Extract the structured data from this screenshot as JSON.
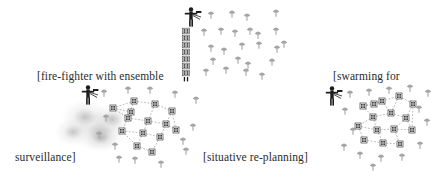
{
  "figure": {
    "kind": "scenario-diagram",
    "background_color": "#ffffff",
    "ink_color": "#2b2b2b",
    "agent_color": "#9a9a9a",
    "node_color": "#4a4a4a",
    "link_color": "#8d8d8d",
    "smoke_color": "#9a9a9a"
  },
  "labels": [
    {
      "id": "label-fire-fighter",
      "text": "[fire-fighter with ensemble",
      "x": 37,
      "y": 71
    },
    {
      "id": "label-surveillance",
      "text": "surveillance]",
      "x": 15,
      "y": 152
    },
    {
      "id": "label-situative-replanning",
      "text": "[situative re-planning]",
      "x": 203,
      "y": 152
    },
    {
      "id": "label-swarming-for",
      "text": "[swarming for",
      "x": 333,
      "y": 71
    }
  ],
  "scenes": [
    {
      "id": "scene-fire-fighter",
      "name": "fire-fighter with ensemble surveillance",
      "human": {
        "x": 88,
        "y": 96
      },
      "smoke_blobs": [
        {
          "x": 62,
          "y": 100,
          "w": 46,
          "h": 34
        },
        {
          "x": 74,
          "y": 112,
          "w": 52,
          "h": 40
        },
        {
          "x": 55,
          "y": 118,
          "w": 36,
          "h": 28
        },
        {
          "x": 92,
          "y": 104,
          "w": 40,
          "h": 30
        },
        {
          "x": 84,
          "y": 126,
          "w": 34,
          "h": 24
        }
      ],
      "nodes": [
        {
          "x": 113,
          "y": 108
        },
        {
          "x": 134,
          "y": 101
        },
        {
          "x": 155,
          "y": 104
        },
        {
          "x": 172,
          "y": 111
        },
        {
          "x": 128,
          "y": 118
        },
        {
          "x": 148,
          "y": 121
        },
        {
          "x": 166,
          "y": 124
        },
        {
          "x": 122,
          "y": 131
        },
        {
          "x": 143,
          "y": 133
        },
        {
          "x": 160,
          "y": 137
        },
        {
          "x": 176,
          "y": 130
        },
        {
          "x": 137,
          "y": 146
        },
        {
          "x": 152,
          "y": 152
        },
        {
          "x": 131,
          "y": 112
        }
      ],
      "links": [
        [
          0,
          1
        ],
        [
          1,
          2
        ],
        [
          2,
          3
        ],
        [
          0,
          4
        ],
        [
          4,
          5
        ],
        [
          5,
          6
        ],
        [
          3,
          6
        ],
        [
          1,
          4
        ],
        [
          2,
          5
        ],
        [
          4,
          7
        ],
        [
          7,
          8
        ],
        [
          8,
          9
        ],
        [
          9,
          6
        ],
        [
          6,
          10
        ],
        [
          3,
          10
        ],
        [
          5,
          8
        ],
        [
          8,
          11
        ],
        [
          11,
          12
        ],
        [
          9,
          12
        ],
        [
          7,
          11
        ],
        [
          0,
          13
        ],
        [
          13,
          4
        ]
      ],
      "agents": [
        {
          "x": 104,
          "y": 93
        },
        {
          "x": 128,
          "y": 90
        },
        {
          "x": 150,
          "y": 90
        },
        {
          "x": 175,
          "y": 94
        },
        {
          "x": 196,
          "y": 100
        },
        {
          "x": 106,
          "y": 118
        },
        {
          "x": 99,
          "y": 135
        },
        {
          "x": 115,
          "y": 146
        },
        {
          "x": 135,
          "y": 160
        },
        {
          "x": 161,
          "y": 164
        },
        {
          "x": 186,
          "y": 151
        },
        {
          "x": 193,
          "y": 127
        },
        {
          "x": 183,
          "y": 141
        },
        {
          "x": 119,
          "y": 159
        }
      ]
    },
    {
      "id": "scene-situative-replanning",
      "name": "situative re-planning",
      "human": {
        "x": 191,
        "y": 18
      },
      "stack": {
        "x": 186,
        "y": 31,
        "count": 7,
        "spacing": 7
      },
      "agents": [
        {
          "x": 211,
          "y": 15
        },
        {
          "x": 232,
          "y": 14
        },
        {
          "x": 247,
          "y": 17
        },
        {
          "x": 276,
          "y": 13
        },
        {
          "x": 204,
          "y": 32
        },
        {
          "x": 221,
          "y": 31
        },
        {
          "x": 235,
          "y": 33
        },
        {
          "x": 250,
          "y": 31
        },
        {
          "x": 258,
          "y": 35
        },
        {
          "x": 276,
          "y": 31
        },
        {
          "x": 211,
          "y": 48
        },
        {
          "x": 224,
          "y": 51
        },
        {
          "x": 242,
          "y": 46
        },
        {
          "x": 259,
          "y": 45
        },
        {
          "x": 277,
          "y": 49
        },
        {
          "x": 213,
          "y": 61
        },
        {
          "x": 238,
          "y": 60
        },
        {
          "x": 248,
          "y": 65
        },
        {
          "x": 272,
          "y": 62
        },
        {
          "x": 226,
          "y": 70
        },
        {
          "x": 246,
          "y": 72
        },
        {
          "x": 262,
          "y": 76
        },
        {
          "x": 206,
          "y": 72
        },
        {
          "x": 284,
          "y": 44
        }
      ]
    },
    {
      "id": "scene-swarming",
      "name": "swarming for surveillance",
      "human": {
        "x": 332,
        "y": 97
      },
      "nodes": [
        {
          "x": 363,
          "y": 106
        },
        {
          "x": 382,
          "y": 101
        },
        {
          "x": 399,
          "y": 96
        },
        {
          "x": 413,
          "y": 104
        },
        {
          "x": 373,
          "y": 117
        },
        {
          "x": 391,
          "y": 113
        },
        {
          "x": 406,
          "y": 118
        },
        {
          "x": 358,
          "y": 126
        },
        {
          "x": 377,
          "y": 130
        },
        {
          "x": 394,
          "y": 129
        },
        {
          "x": 412,
          "y": 130
        },
        {
          "x": 364,
          "y": 140
        },
        {
          "x": 383,
          "y": 143
        },
        {
          "x": 400,
          "y": 144
        },
        {
          "x": 374,
          "y": 104
        }
      ],
      "links": [
        [
          0,
          1
        ],
        [
          1,
          2
        ],
        [
          2,
          3
        ],
        [
          1,
          5
        ],
        [
          0,
          4
        ],
        [
          4,
          5
        ],
        [
          5,
          6
        ],
        [
          3,
          6
        ],
        [
          2,
          5
        ],
        [
          4,
          8
        ],
        [
          7,
          8
        ],
        [
          8,
          9
        ],
        [
          9,
          6
        ],
        [
          6,
          10
        ],
        [
          3,
          10
        ],
        [
          9,
          10
        ],
        [
          7,
          11
        ],
        [
          11,
          12
        ],
        [
          12,
          13
        ],
        [
          8,
          12
        ],
        [
          9,
          13
        ],
        [
          0,
          14
        ],
        [
          14,
          1
        ],
        [
          4,
          7
        ]
      ],
      "agents": [
        {
          "x": 350,
          "y": 94
        },
        {
          "x": 369,
          "y": 92
        },
        {
          "x": 389,
          "y": 90
        },
        {
          "x": 410,
          "y": 88
        },
        {
          "x": 428,
          "y": 93
        },
        {
          "x": 345,
          "y": 111
        },
        {
          "x": 353,
          "y": 131
        },
        {
          "x": 344,
          "y": 147
        },
        {
          "x": 360,
          "y": 155
        },
        {
          "x": 381,
          "y": 158
        },
        {
          "x": 402,
          "y": 157
        },
        {
          "x": 420,
          "y": 145
        },
        {
          "x": 427,
          "y": 122
        },
        {
          "x": 419,
          "y": 109
        },
        {
          "x": 373,
          "y": 167
        }
      ]
    }
  ]
}
